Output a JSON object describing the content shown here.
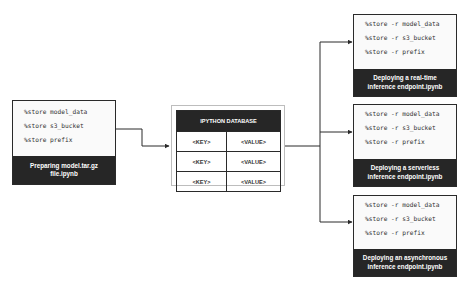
{
  "source_notebook": {
    "lines": [
      "%store model_data",
      "%store s3_bucket",
      "%store prefix"
    ],
    "title": "Preparing model.tar.gz file.ipynb"
  },
  "database": {
    "title": "IPYTHON DATABASE",
    "rows": [
      {
        "key": "<KEY>",
        "value": "<VALUE>"
      },
      {
        "key": "<KEY>",
        "value": "<VALUE>"
      },
      {
        "key": "<KEY>",
        "value": "<VALUE>"
      }
    ]
  },
  "target_notebooks": [
    {
      "lines": [
        "%store -r model_data",
        "%store -r s3_bucket",
        "%store -r prefix"
      ],
      "title": "Deploying a real-time inference endpoint.ipynb"
    },
    {
      "lines": [
        "%store -r model_data",
        "%store -r s3_bucket",
        "%store -r prefix"
      ],
      "title": "Deploying a serverless inference endpoint.ipynb"
    },
    {
      "lines": [
        "%store -r model_data",
        "%store -r s3_bucket",
        "%store -r prefix"
      ],
      "title": "Deploying an asynchronous inference endpoint.ipynb"
    }
  ],
  "colors": {
    "dark": "#262626",
    "line": "#2a2a2a",
    "panel": "#fafafa"
  }
}
